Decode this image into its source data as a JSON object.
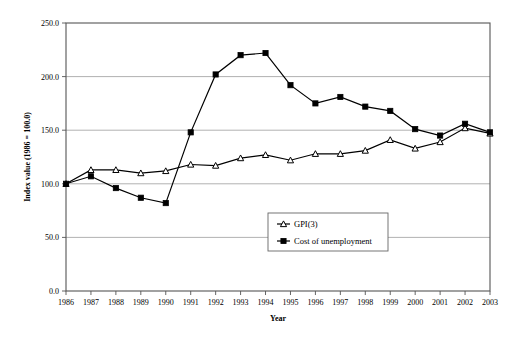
{
  "chart_data": {
    "type": "line",
    "title": "",
    "xlabel": "Year",
    "ylabel": "Index value (1986 = 100.0)",
    "categories": [
      "1986",
      "1987",
      "1988",
      "1989",
      "1990",
      "1991",
      "1992",
      "1993",
      "1994",
      "1995",
      "1996",
      "1997",
      "1998",
      "1999",
      "2000",
      "2001",
      "2002",
      "2003"
    ],
    "x": [
      1986,
      1987,
      1988,
      1989,
      1990,
      1991,
      1992,
      1993,
      1994,
      1995,
      1996,
      1997,
      1998,
      1999,
      2000,
      2001,
      2002,
      2003
    ],
    "ylim": [
      0,
      250
    ],
    "xlim": [
      1986,
      2003
    ],
    "yticks": [
      "0.0",
      "50.0",
      "100.0",
      "150.0",
      "200.0",
      "250.0"
    ],
    "ytick_values": [
      0,
      50,
      100,
      150,
      200,
      250
    ],
    "grid": "horizontal",
    "legend_position": "center",
    "series": [
      {
        "name": "GPI(3)",
        "marker": "triangle-open",
        "values": [
          100,
          113,
          113,
          110,
          112,
          118,
          117,
          124,
          127,
          122,
          128,
          128,
          131,
          141,
          133,
          139,
          152,
          147
        ]
      },
      {
        "name": "Cost of unemployment",
        "marker": "square-filled",
        "values": [
          100,
          107,
          96,
          87,
          82,
          148,
          202,
          220,
          222,
          192,
          175,
          181,
          172,
          168,
          151,
          145,
          156,
          148
        ]
      }
    ]
  },
  "legend": {
    "items": [
      {
        "label": "GPI(3)"
      },
      {
        "label": "Cost of unemployment"
      }
    ]
  },
  "colors": {
    "line": "#000000",
    "grid": "#a8a8a8",
    "axis": "#555555",
    "background": "#ffffff"
  }
}
